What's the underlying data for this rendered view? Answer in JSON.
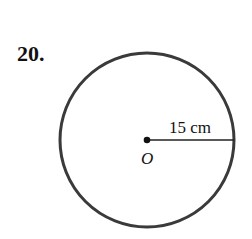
{
  "problem": {
    "number": "20."
  },
  "figure": {
    "center_label": "O",
    "radius_label": "15 cm",
    "stroke_color": "#3a3a3a"
  }
}
